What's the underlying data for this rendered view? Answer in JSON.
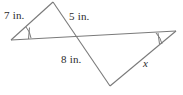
{
  "figure": {
    "stroke_color": "#7a7a7a",
    "label_color": "#2b2b2b",
    "background_color": "#ffffff",
    "labels": {
      "side_7": "7 in.",
      "side_5": "5 in.",
      "side_8": "8 in.",
      "side_x": "x"
    },
    "angle_marks": {
      "left_vertex": "single-tick-arc",
      "right_vertex": "single-tick-arc"
    },
    "points": {
      "left_vertex": "11,40",
      "top_apex": "53,2",
      "crossing": "75,37",
      "bottom_vertex": "110,86",
      "right_vertex": "176,31"
    }
  }
}
